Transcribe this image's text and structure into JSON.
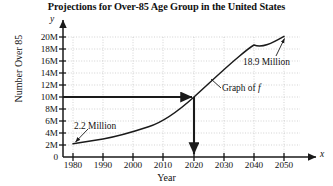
{
  "chart_data": {
    "type": "line",
    "title": "Projections for Over-85 Age Group in the United States",
    "xlabel": "Year",
    "ylabel": "Number Over 85",
    "x_symbol": "x",
    "y_symbol": "y",
    "grid": true,
    "legend_position": "inline-annotation",
    "xlim": [
      1980,
      2050
    ],
    "ylim": [
      0,
      20
    ],
    "x_ticks": [
      1980,
      1990,
      2000,
      2010,
      2020,
      2030,
      2040,
      2050
    ],
    "x_tick_labels": [
      "1980",
      "1990",
      "2000",
      "2010",
      "2020",
      "2030",
      "2040",
      "2050"
    ],
    "y_ticks": [
      0,
      2,
      4,
      6,
      8,
      10,
      12,
      14,
      16,
      18,
      20
    ],
    "y_tick_labels": [
      "0",
      "2M",
      "4M",
      "6M",
      "8M",
      "10M",
      "12M",
      "14M",
      "16M",
      "18M",
      "20M"
    ],
    "y_unit": "millions",
    "series": [
      {
        "name": "Graph of f",
        "x": [
          1980,
          1990,
          2000,
          2010,
          2020,
          2030,
          2040,
          2050
        ],
        "values": [
          2.2,
          3.0,
          4.3,
          5.8,
          8.0,
          12.6,
          17.0,
          18.9
        ]
      }
    ],
    "annotations": [
      {
        "text": "2.2 Million",
        "points_to_x": 1980,
        "points_to_y": 2.2
      },
      {
        "text": "18.9 Million",
        "points_to_x": 2050,
        "points_to_y": 18.9
      },
      {
        "text": "Graph of f",
        "points_to_x": 2026,
        "points_to_y": 10.8
      }
    ],
    "reference_lines": [
      {
        "orientation": "horizontal",
        "value": 8,
        "from_x": 1980,
        "to_x": 2020,
        "style": "solid-arrow"
      },
      {
        "orientation": "vertical",
        "value": 2020,
        "from_y": 8,
        "to_y": 0,
        "style": "solid-arrow"
      }
    ],
    "colors": {
      "curve": "#1a1a1a",
      "grid": "#c8c8c8",
      "axis": "#1a1a1a",
      "background": "#ffffff"
    }
  }
}
